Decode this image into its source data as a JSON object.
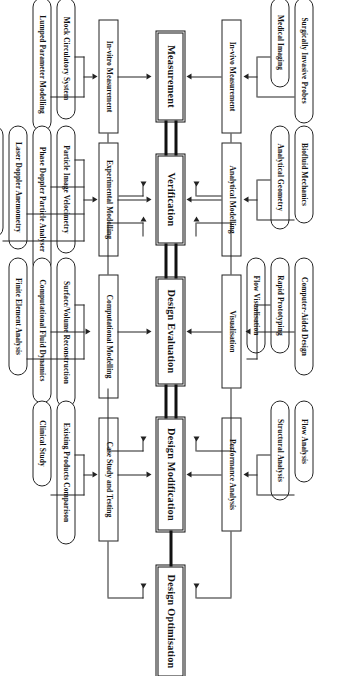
{
  "diagram": {
    "orientation": "rotated-90-clockwise",
    "spine": [
      {
        "id": "measurement",
        "label": "Measurement"
      },
      {
        "id": "verification",
        "label": "Verification"
      },
      {
        "id": "design_evaluation",
        "label": "Design Evaluation"
      },
      {
        "id": "design_modification",
        "label": "Design Modification"
      },
      {
        "id": "design_optimisation",
        "label": "Design Optimisation"
      }
    ],
    "columns": [
      {
        "spine": "Measurement",
        "upper_mid": "In-vivo Measurement",
        "upper_leaves": [
          "Medical Imaging",
          "Surgically Invasive Probes"
        ],
        "lower_mid": "In-vitro Measurement",
        "lower_leaves": [
          "Mock Circulatory System",
          "Lumped Parameter Modelling"
        ]
      },
      {
        "spine": "Verification",
        "upper_mid": "Analytical Modelling",
        "upper_leaves": [
          "Analytical Geometry",
          "Biofluid Mechanics"
        ],
        "lower_mid": "Experimental Modelling",
        "lower_leaves": [
          "Particle Image Velocimetry",
          "Phase Doppler Particle Analyser",
          "Laser Doppler Anemometry",
          "Hot-Film Anemometry"
        ]
      },
      {
        "spine": "Design Evaluation",
        "upper_mid": "Visualisation",
        "upper_leaves": [
          "Rapid Prototyping",
          "Computer-Aided Design",
          "Flow Visualisation"
        ],
        "lower_mid": "Computational Modelling",
        "lower_leaves": [
          "Surface/Volume Reconstruction",
          "Computational Fluid Dynamics",
          "Finite Element Analysis"
        ]
      },
      {
        "spine": "Design Modification",
        "upper_mid": "Performance Analysis",
        "upper_leaves": [
          "Structural Analysis",
          "Flow Analysis"
        ],
        "lower_mid": "Case Study and Testing",
        "lower_leaves": [
          "Existing Products Comparison",
          "Clinical Study"
        ]
      },
      {
        "spine": "Design Optimisation",
        "upper_mid": "",
        "upper_leaves": [],
        "lower_mid": "",
        "lower_leaves": []
      }
    ],
    "colors": {
      "stroke": "#222222",
      "spine_stroke": "#111111",
      "background": "#ffffff"
    }
  }
}
